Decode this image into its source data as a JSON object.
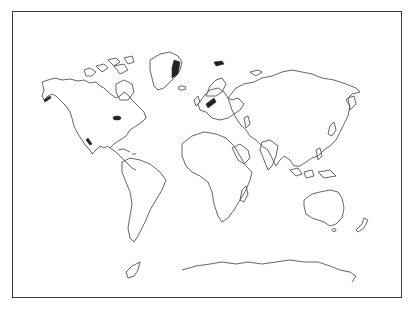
{
  "map": {
    "type": "outline world map",
    "projection": "equirectangular-like",
    "title": "",
    "frame_color": "#3a3a3a",
    "coastline_color": "#555555",
    "background": "#ffffff",
    "regions": [
      {
        "id": "north-america",
        "label": "North America"
      },
      {
        "id": "greenland",
        "label": "Greenland"
      },
      {
        "id": "south-america",
        "label": "South America"
      },
      {
        "id": "europe",
        "label": "Europe"
      },
      {
        "id": "africa",
        "label": "Africa"
      },
      {
        "id": "asia",
        "label": "Asia"
      },
      {
        "id": "australia",
        "label": "Australia"
      },
      {
        "id": "new-zealand",
        "label": "New Zealand"
      },
      {
        "id": "antarctica",
        "label": "Antarctica"
      },
      {
        "id": "madagascar",
        "label": "Madagascar"
      },
      {
        "id": "japan",
        "label": "Japan"
      },
      {
        "id": "indonesia",
        "label": "Indonesia"
      }
    ]
  }
}
